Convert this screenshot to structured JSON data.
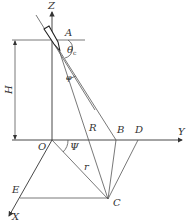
{
  "diagram": {
    "axes": {
      "z_label": "Z",
      "y_label": "Y",
      "x_label": "X"
    },
    "points": {
      "A": "A",
      "O": "O",
      "B": "B",
      "C": "C",
      "D": "D",
      "E": "E"
    },
    "dimensions": {
      "height_label": "H",
      "slant_range_label": "R",
      "horizontal_range_label": "r"
    },
    "angles": {
      "theta_label": "θ",
      "theta_sub": "c",
      "phi_label": "φ",
      "psi_label": "Ψ"
    },
    "colors": {
      "line": "#555555",
      "axis": "#333333",
      "text": "#333333",
      "background": "#ffffff"
    }
  }
}
